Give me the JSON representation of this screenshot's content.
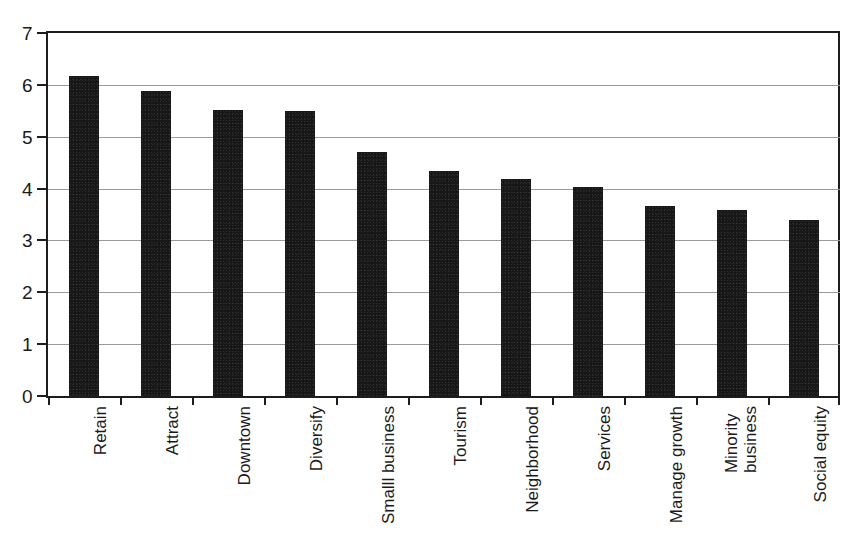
{
  "chart_data": {
    "type": "bar",
    "title": "",
    "subtitle": "",
    "xlabel": "",
    "ylabel": "",
    "ylim": [
      0,
      7
    ],
    "yticks": [
      "0",
      "1",
      "2",
      "3",
      "4",
      "5",
      "6",
      "7"
    ],
    "grid": true,
    "legend": false,
    "orientation": "vertical",
    "bar_color": "#171717",
    "gridline_color": "#9a9a9a",
    "axis_color": "#1d1d1d",
    "categories": [
      "Retain",
      "Attract",
      "Downtown",
      "Diversify",
      "Smalll business",
      "Tourism",
      "Neighborhood",
      "Services",
      "Manage growth",
      "Minority business",
      "Social equity"
    ],
    "category_label_lines": [
      [
        "Retain"
      ],
      [
        "Attract"
      ],
      [
        "Downtown"
      ],
      [
        "Diversify"
      ],
      [
        "Smalll business"
      ],
      [
        "Tourism"
      ],
      [
        "Neighborhood"
      ],
      [
        "Services"
      ],
      [
        "Manage growth"
      ],
      [
        "Minority",
        "business"
      ],
      [
        "Social equity"
      ]
    ],
    "values": [
      6.17,
      5.89,
      5.52,
      5.5,
      4.7,
      4.34,
      4.18,
      4.03,
      3.66,
      3.59,
      3.39
    ]
  }
}
